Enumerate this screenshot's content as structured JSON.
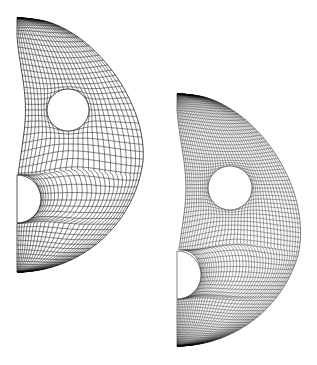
{
  "figure": {
    "background_color": "#ffffff",
    "line_color": "#1a1a1a",
    "boundary_color": "#000000",
    "width": 317,
    "height": 365,
    "panel_count": 2
  },
  "chart_data": {
    "type": "diagram",
    "subtype": "finite-element-mesh",
    "xlabel": "",
    "ylabel": "",
    "grid": false,
    "legend": "none",
    "panels": [
      {
        "name": "coarse-mesh",
        "label": "",
        "domain": "half-disc (right half), flat edge on the left",
        "center_x": 17.0,
        "center_y": 145.0,
        "outer_radius": 127.0,
        "start_angle_deg": -90,
        "end_angle_deg": 90,
        "hole": {
          "name": "circular-hole",
          "center_x": 68.0,
          "center_y": 110.0,
          "radius": 21.0
        },
        "notch": {
          "name": "semicircular-notch",
          "center_x": 17.0,
          "center_y": 199.0,
          "radius": 24.0
        },
        "radial_divisions": 26,
        "circumferential_divisions": 56,
        "element_count_approx": 1456,
        "density": "coarse",
        "bbox": [
          17,
          18,
          136,
          272
        ]
      },
      {
        "name": "refined-mesh",
        "label": "",
        "domain": "half-disc (right half), flat edge on the left",
        "center_x": 177.0,
        "center_y": 220.0,
        "outer_radius": 126.0,
        "start_angle_deg": -90,
        "end_angle_deg": 90,
        "hole": {
          "name": "circular-hole",
          "center_x": 230.0,
          "center_y": 188.0,
          "radius": 22.0
        },
        "notch": {
          "name": "semicircular-notch",
          "center_x": 177.0,
          "center_y": 275.0,
          "radius": 24.0
        },
        "radial_divisions": 40,
        "circumferential_divisions": 86,
        "element_count_approx": 3440,
        "density": "fine",
        "bbox": [
          177,
          93,
          303,
          347
        ]
      }
    ]
  }
}
